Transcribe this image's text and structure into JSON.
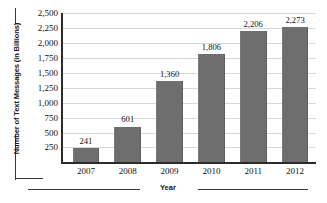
{
  "chart_data": {
    "type": "bar",
    "title": "",
    "xlabel": "Year",
    "ylabel": "Number of Text Messages (in Billions)",
    "categories": [
      "2007",
      "2008",
      "2009",
      "2010",
      "2011",
      "2012"
    ],
    "values": [
      241,
      601,
      1360,
      1806,
      2206,
      2273
    ],
    "value_labels": [
      "241",
      "601",
      "1,360",
      "1,806",
      "2,206",
      "2,273"
    ],
    "ylim": [
      0,
      2500
    ],
    "yticks": [
      250,
      500,
      750,
      1000,
      1250,
      1500,
      1750,
      2000,
      2250,
      2500
    ],
    "ytick_labels": [
      "250",
      "500",
      "750",
      "1,000",
      "1,250",
      "1,500",
      "1,750",
      "2,000",
      "2,250",
      "2,500"
    ],
    "grid": true,
    "legend": false,
    "legend_position": "none",
    "bar_color": "#6e6e6e",
    "grid_color": "#d8d8d8",
    "axis_color": "#2b2b2b",
    "text_color": "#111111"
  }
}
